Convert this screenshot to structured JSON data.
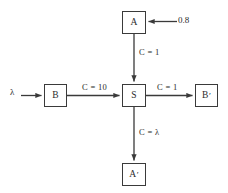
{
  "diagram": {
    "type": "flow-network",
    "nodes": [
      {
        "id": "A",
        "label": "A",
        "prime": false,
        "x": 122,
        "y": 11,
        "w": 24,
        "h": 23
      },
      {
        "id": "B",
        "label": "B",
        "prime": false,
        "x": 44,
        "y": 84,
        "w": 23,
        "h": 23
      },
      {
        "id": "S",
        "label": "S",
        "prime": false,
        "x": 122,
        "y": 84,
        "w": 24,
        "h": 23
      },
      {
        "id": "Bprime",
        "label": "B",
        "prime": true,
        "x": 195,
        "y": 84,
        "w": 23,
        "h": 23
      },
      {
        "id": "Aprime",
        "label": "A",
        "prime": true,
        "x": 122,
        "y": 163,
        "w": 24,
        "h": 23
      }
    ],
    "edges": [
      {
        "from": "source-0.8",
        "to": "A",
        "label": "",
        "direction": "left"
      },
      {
        "from": "A",
        "to": "S",
        "label": "C = 1",
        "direction": "down"
      },
      {
        "from": "source-lambda",
        "to": "B",
        "label": "",
        "direction": "right"
      },
      {
        "from": "B",
        "to": "S",
        "label": "C = 10",
        "direction": "right"
      },
      {
        "from": "S",
        "to": "Bprime",
        "label": "C = 1",
        "direction": "right"
      },
      {
        "from": "S",
        "to": "Aprime",
        "label": "C = λ",
        "direction": "down"
      }
    ],
    "labels": {
      "node_a": "A",
      "node_b": "B",
      "node_s": "S",
      "node_b_prime": "B",
      "node_a_prime": "A",
      "prime_mark": "′",
      "input_rate": "λ",
      "input_weight": "0.8",
      "cap_a_to_s": "C = 1",
      "cap_b_to_s": "C = 10",
      "cap_s_to_bprime": "C = 1",
      "cap_s_to_aprime": "C = λ"
    },
    "colors": {
      "stroke": "#3a3a3a",
      "text": "#2b2b2b",
      "background": "#ffffff"
    }
  }
}
